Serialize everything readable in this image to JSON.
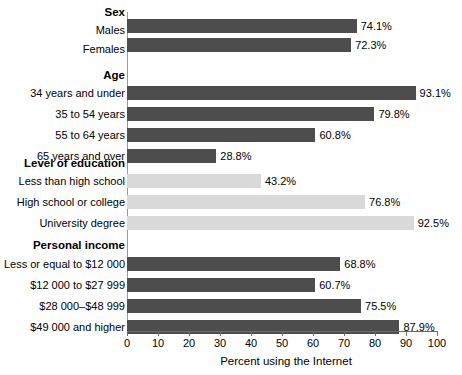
{
  "chart_data": {
    "type": "bar",
    "orientation": "horizontal",
    "title": "",
    "xlabel": "Percent using the Internet",
    "ylabel": "",
    "xlim": [
      0,
      100
    ],
    "xticks": [
      0,
      10,
      20,
      30,
      40,
      50,
      60,
      70,
      80,
      90,
      100
    ],
    "grid": false,
    "legend": "none",
    "value_label_suffix": "%",
    "colors": {
      "dark_bar": "#4d4d4d",
      "light_bar": "#d9d9d9",
      "axis": "#6b6b6b",
      "text": "#000000",
      "background": "#ffffff"
    },
    "groups": [
      {
        "name": "Sex",
        "color": "dark",
        "categories": [
          "Males",
          "Females"
        ],
        "values": [
          74.1,
          72.3
        ],
        "value_labels": [
          "74.1%",
          "72.3%"
        ]
      },
      {
        "name": "Age",
        "color": "dark",
        "categories": [
          "34 years and under",
          "35 to 54 years",
          "55 to 64 years",
          "65 years and over"
        ],
        "values": [
          93.1,
          79.8,
          60.8,
          28.8
        ],
        "value_labels": [
          "93.1%",
          "79.8%",
          "60.8%",
          "28.8%"
        ]
      },
      {
        "name": "Level of education",
        "color": "light",
        "categories": [
          "Less than high school",
          "High school or college",
          "University degree"
        ],
        "values": [
          43.2,
          76.8,
          92.5
        ],
        "value_labels": [
          "43.2%",
          "76.8%",
          "92.5%"
        ]
      },
      {
        "name": "Personal income",
        "color": "dark",
        "categories": [
          "Less or equal to $12 000",
          "$12 000 to $27 999",
          "$28 000–$48 999",
          "$49 000 and higher"
        ],
        "values": [
          68.8,
          60.7,
          75.5,
          87.9
        ],
        "value_labels": [
          "68.8%",
          "60.7%",
          "75.5%",
          "87.9%"
        ]
      }
    ]
  }
}
